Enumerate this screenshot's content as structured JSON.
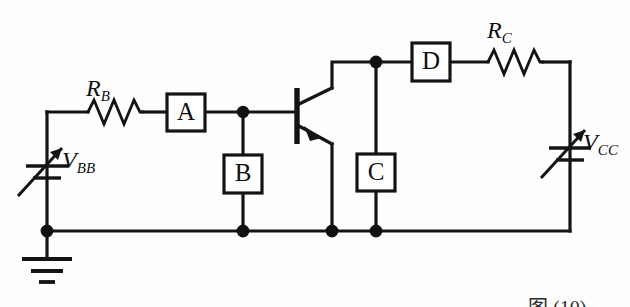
{
  "figure": {
    "type": "circuit-schematic",
    "caption": "图 (10)",
    "background_color": "#fefefe",
    "line_color": "#141414"
  },
  "components": {
    "resistors": [
      {
        "id": "RB",
        "base": "R",
        "sub": "B",
        "orientation": "horizontal",
        "branch": "base-bias"
      },
      {
        "id": "RC",
        "base": "R",
        "sub": "C",
        "orientation": "horizontal",
        "branch": "collector-supply"
      }
    ],
    "sources": [
      {
        "id": "VBB",
        "base": "V",
        "sub": "BB",
        "kind": "variable-dc-source",
        "orientation": "vertical",
        "side": "left"
      },
      {
        "id": "VCC",
        "base": "V",
        "sub": "CC",
        "kind": "variable-dc-source",
        "orientation": "vertical",
        "side": "right"
      }
    ],
    "instrument_boxes": [
      {
        "label": "A",
        "orientation": "horizontal",
        "connection": "series",
        "branch": "base-lead"
      },
      {
        "label": "B",
        "orientation": "vertical",
        "connection": "shunt",
        "branch": "base-to-ground"
      },
      {
        "label": "C",
        "orientation": "vertical",
        "connection": "shunt",
        "branch": "collector-to-ground"
      },
      {
        "label": "D",
        "orientation": "horizontal",
        "connection": "series",
        "branch": "collector-lead"
      }
    ],
    "transistor": {
      "kind": "npn-bjt",
      "terminals": [
        "base",
        "collector",
        "emitter"
      ],
      "base_side": "left",
      "collector_side": "top-right",
      "emitter_side": "bottom-right",
      "emitter_arrow": "outward"
    },
    "ground": {
      "kind": "earth-ground",
      "bars": 3,
      "location": "bottom-left"
    },
    "junction_nodes": [
      {
        "name": "base-node",
        "x": 243,
        "y": 112
      },
      {
        "name": "collector-node",
        "x": 376,
        "y": 62
      },
      {
        "name": "ground-rail-left-node",
        "x": 47,
        "y": 231
      },
      {
        "name": "ground-rail-b-node",
        "x": 243,
        "y": 231
      },
      {
        "name": "ground-rail-emitter-node",
        "x": 332,
        "y": 231
      },
      {
        "name": "ground-rail-c-node",
        "x": 376,
        "y": 231
      }
    ]
  },
  "geometry": {
    "rail_y": 231,
    "base_y": 112,
    "collector_y": 62,
    "left_wire_x": 47,
    "right_wire_x": 570,
    "emitter_wire_x": 332,
    "collector_tap_x": 376
  }
}
